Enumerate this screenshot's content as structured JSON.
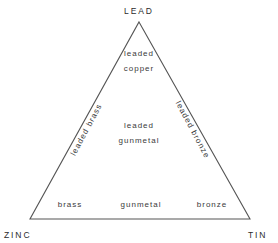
{
  "diagram": {
    "type": "ternary",
    "background_color": "#ffffff",
    "stroke_color": "#555555",
    "text_color": "#333333",
    "vertices": [
      {
        "id": "lead",
        "label": "LEAD",
        "position": "apex",
        "x": 139,
        "y": 22
      },
      {
        "id": "zinc",
        "label": "ZINC",
        "position": "bottom-left",
        "x": 30,
        "y": 219
      },
      {
        "id": "tin",
        "label": "TIN",
        "position": "bottom-right",
        "x": 250,
        "y": 219
      }
    ],
    "regions": [
      {
        "id": "leaded-copper",
        "line1": "leaded",
        "line2": "copper",
        "x": 139,
        "y": 62
      },
      {
        "id": "leaded-gunmetal",
        "line1": "leaded",
        "line2": "gunmetal",
        "x": 139,
        "y": 134
      },
      {
        "id": "brass",
        "label": "brass",
        "x": 70,
        "y": 205
      },
      {
        "id": "gunmetal",
        "label": "gunmetal",
        "x": 141,
        "y": 205
      },
      {
        "id": "bronze",
        "label": "bronze",
        "x": 212,
        "y": 205
      }
    ],
    "edge_regions": [
      {
        "id": "leaded-brass",
        "label": "leaded brass",
        "edge": "left",
        "x": 87,
        "y": 130,
        "rotation_deg": -62
      },
      {
        "id": "leaded-bronze",
        "label": "leaded bronze",
        "edge": "right",
        "x": 192,
        "y": 130,
        "rotation_deg": 62
      }
    ]
  }
}
